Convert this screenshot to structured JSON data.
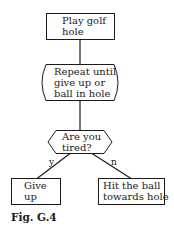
{
  "diagram": {
    "type": "flowchart",
    "nodes": {
      "start": {
        "shape": "rectangle",
        "label": "Play golf\nhole"
      },
      "loop": {
        "shape": "rounded-side-box",
        "label": "Repeat until\ngive up or\nball in hole"
      },
      "decision": {
        "shape": "hexagon",
        "label": "Are you\ntired?"
      },
      "yes_action": {
        "shape": "rectangle",
        "label": "Give\nup"
      },
      "no_action": {
        "shape": "rectangle",
        "label": "Hit the ball\ntowards hole"
      }
    },
    "edges": [
      {
        "from": "start",
        "to": "loop",
        "label": ""
      },
      {
        "from": "loop",
        "to": "decision",
        "label": ""
      },
      {
        "from": "decision",
        "to": "yes_action",
        "label": "y"
      },
      {
        "from": "decision",
        "to": "no_action",
        "label": "n"
      }
    ],
    "caption": "Fig. G.4"
  },
  "colors": {
    "stroke": "#1a1a1a",
    "background": "#ffffff"
  }
}
